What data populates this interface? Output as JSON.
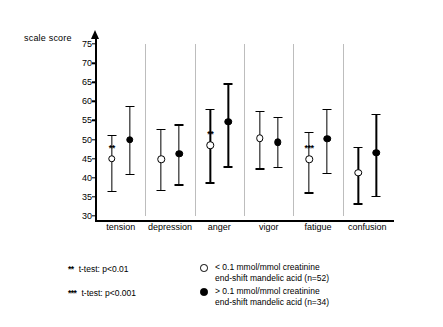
{
  "chart_data": {
    "type": "scatter",
    "title": "",
    "ylabel": "scale score",
    "xlabel": "",
    "ylim": [
      30,
      75
    ],
    "yticks": [
      30,
      35,
      40,
      45,
      50,
      55,
      60,
      65,
      70,
      75
    ],
    "grid": false,
    "categories": [
      "tension",
      "depression",
      "anger",
      "vigor",
      "fatigue",
      "confusion"
    ],
    "series": [
      {
        "name": "< 0.1 mmol/mmol creatinine end-shift mandelic acid (n=52)",
        "marker": "open-circle",
        "values": [
          45.0,
          44.8,
          48.5,
          50.3,
          44.8,
          41.3
        ],
        "err_low": [
          36.5,
          36.8,
          38.8,
          42.5,
          36.2,
          33.3
        ],
        "err_high": [
          51.3,
          52.8,
          58.0,
          57.5,
          52.0,
          48.0
        ]
      },
      {
        "name": "> 0.1 mmol/mmol creatinine end-shift mandelic acid (n=34)",
        "marker": "filled-circle",
        "values": [
          50.0,
          46.3,
          54.7,
          49.3,
          50.2,
          46.6
        ],
        "err_low": [
          41.0,
          38.3,
          43.0,
          42.8,
          41.3,
          35.3
        ],
        "err_high": [
          58.8,
          54.0,
          64.7,
          56.0,
          58.0,
          56.8
        ]
      }
    ],
    "annotations": [
      {
        "category": "tension",
        "text": "**",
        "level": "p<0.01"
      },
      {
        "category": "anger",
        "text": "**",
        "level": "p<0.01"
      },
      {
        "category": "fatigue",
        "text": "***",
        "level": "p<0.001"
      }
    ]
  },
  "legend": {
    "sig_rows": [
      {
        "stars": "**",
        "text": "t-test: p<0.01"
      },
      {
        "stars": "***",
        "text": "t-test: p<0.001"
      }
    ],
    "series_rows": [
      {
        "marker": "open",
        "line1": "< 0.1 mmol/mmol creatinine",
        "line2": "end-shift mandelic acid (n=52)"
      },
      {
        "marker": "filled",
        "line1": "> 0.1 mmol/mmol creatinine",
        "line2": "end-shift mandelic acid (n=34)"
      }
    ]
  }
}
